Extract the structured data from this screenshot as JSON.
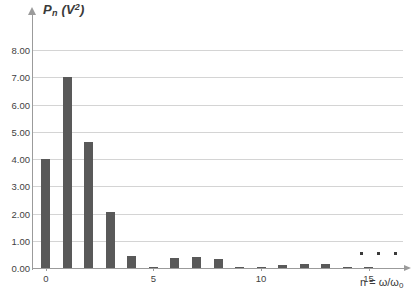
{
  "chart_data": {
    "type": "bar",
    "title": "",
    "subtitle": "",
    "ylabel": "Pn (V2)",
    "ylabel_parts": {
      "main": "P",
      "sub": "n",
      "unit_open": " (V",
      "unit_sup": "2",
      "unit_close": ")"
    },
    "xlabel": "n = ω/ω0",
    "xlabel_parts": {
      "lead": "n = ω/ω",
      "sub": "0"
    },
    "grid": true,
    "legend": "none",
    "xlim": [
      -0.6,
      16.6
    ],
    "ylim": [
      0,
      8
    ],
    "ytick_labels": [
      "8.00",
      "7.00",
      "6.00",
      "5.00",
      "4.00",
      "3.00",
      "2.00",
      "1.00",
      "0.00"
    ],
    "ytick_values": [
      8,
      7,
      6,
      5,
      4,
      3,
      2,
      1,
      0
    ],
    "xtick_labels": [
      "0",
      "5",
      "10",
      "15"
    ],
    "xtick_values": [
      0,
      5,
      10,
      15
    ],
    "categories": [
      0,
      1,
      2,
      3,
      4,
      5,
      6,
      7,
      8,
      9,
      10,
      11,
      12,
      13,
      14,
      15
    ],
    "values": [
      4.0,
      7.0,
      4.63,
      2.05,
      0.45,
      0.03,
      0.35,
      0.42,
      0.32,
      0.05,
      0.02,
      0.1,
      0.14,
      0.13,
      0.04,
      0.02
    ],
    "bar_color": "#595959",
    "grid_color": "#d4d4d4",
    "axis_color": "#9b9b9b",
    "annotations": [
      "ellipsis dots above axis past n = 15 indicating continuation"
    ]
  },
  "axes": {
    "y_arrow": "up-arrow-icon",
    "x_arrow": "right-arrow-icon"
  },
  "ellipsis": {
    "dots": [
      "▪",
      "▪",
      "▪"
    ]
  }
}
